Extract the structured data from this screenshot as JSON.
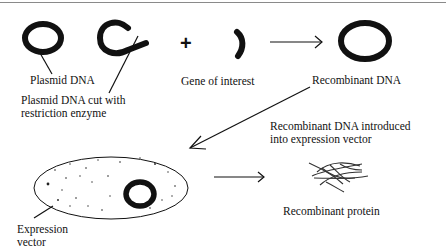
{
  "diagram": {
    "title": "",
    "nodes": [
      {
        "id": "plasmid",
        "label": "Plasmid DNA",
        "shape": "thick-ring"
      },
      {
        "id": "cut_plasmid",
        "label_line1": "Plasmid DNA cut with",
        "label_line2": "restriction enzyme",
        "shape": "open-ring"
      },
      {
        "id": "gene",
        "label": "Gene of interest",
        "shape": "arc-fragment"
      },
      {
        "id": "recombinant_dna",
        "label": "Recombinant DNA",
        "shape": "thick-ring"
      },
      {
        "id": "expression_vector",
        "label_line1": "Expression",
        "label_line2": "vector",
        "shape": "dotted-ellipse-with-ring"
      },
      {
        "id": "recombinant_protein",
        "label": "Recombinant protein",
        "shape": "tangled-strands"
      }
    ],
    "operators": {
      "plus": "+"
    },
    "edges": [
      {
        "from": "gene",
        "to": "recombinant_dna",
        "label": ""
      },
      {
        "from": "recombinant_dna",
        "to": "expression_vector",
        "label_line1": "Recombinant DNA introduced",
        "label_line2": "into expression vector"
      },
      {
        "from": "expression_vector",
        "to": "recombinant_protein",
        "label": ""
      }
    ],
    "colors": {
      "ink": "#111111",
      "background": "#ffffff",
      "border": "#8a8a8a"
    }
  }
}
